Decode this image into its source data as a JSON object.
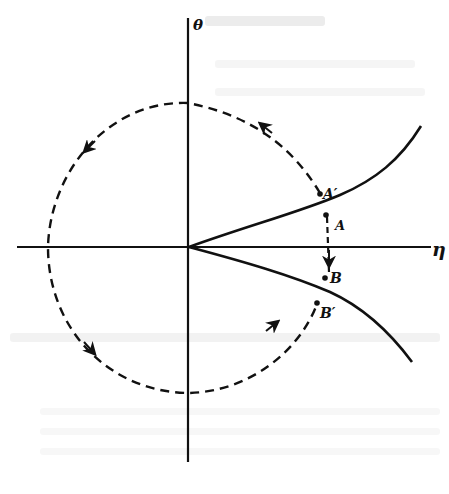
{
  "figure": {
    "type": "phase-plane diagram",
    "axes": {
      "horizontal_label": "η",
      "vertical_label": "θ"
    },
    "curves": [
      {
        "name": "upper-separatrix",
        "style": "solid"
      },
      {
        "name": "lower-separatrix",
        "style": "solid"
      }
    ],
    "trajectories": [
      {
        "name": "circular-orbit",
        "style": "dashed",
        "direction": "counterclockwise",
        "from": "A'",
        "to": "B'"
      },
      {
        "name": "jump",
        "style": "dashed",
        "from": "A",
        "to": "B"
      }
    ],
    "points": [
      {
        "id": "A_prime",
        "label": "A′"
      },
      {
        "id": "A",
        "label": "A"
      },
      {
        "id": "B",
        "label": "B"
      },
      {
        "id": "B_prime",
        "label": "B′"
      }
    ],
    "colors": {
      "ink": "#111111",
      "paper": "#ffffff"
    }
  }
}
